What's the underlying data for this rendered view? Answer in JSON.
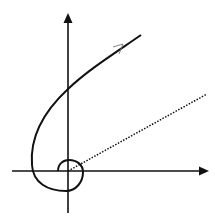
{
  "diagram": {
    "title": "",
    "colors": {
      "background": "#ffffff",
      "stroke": "#111111"
    },
    "axes": {
      "origin": [
        68,
        171
      ],
      "x_axis": {
        "from": [
          12,
          171
        ],
        "to": [
          208,
          171
        ],
        "arrow": true
      },
      "y_axis": {
        "from": [
          68,
          213
        ],
        "to": [
          68,
          14
        ],
        "arrow": true
      }
    },
    "curve": {
      "style": "solid",
      "direction_arrow": true,
      "points_description": "spiral starting near origin, winding counter-clockwise and heading up-right"
    },
    "radial_line": {
      "style": "dotted",
      "from": [
        68,
        171
      ],
      "to": [
        207,
        94
      ]
    }
  }
}
